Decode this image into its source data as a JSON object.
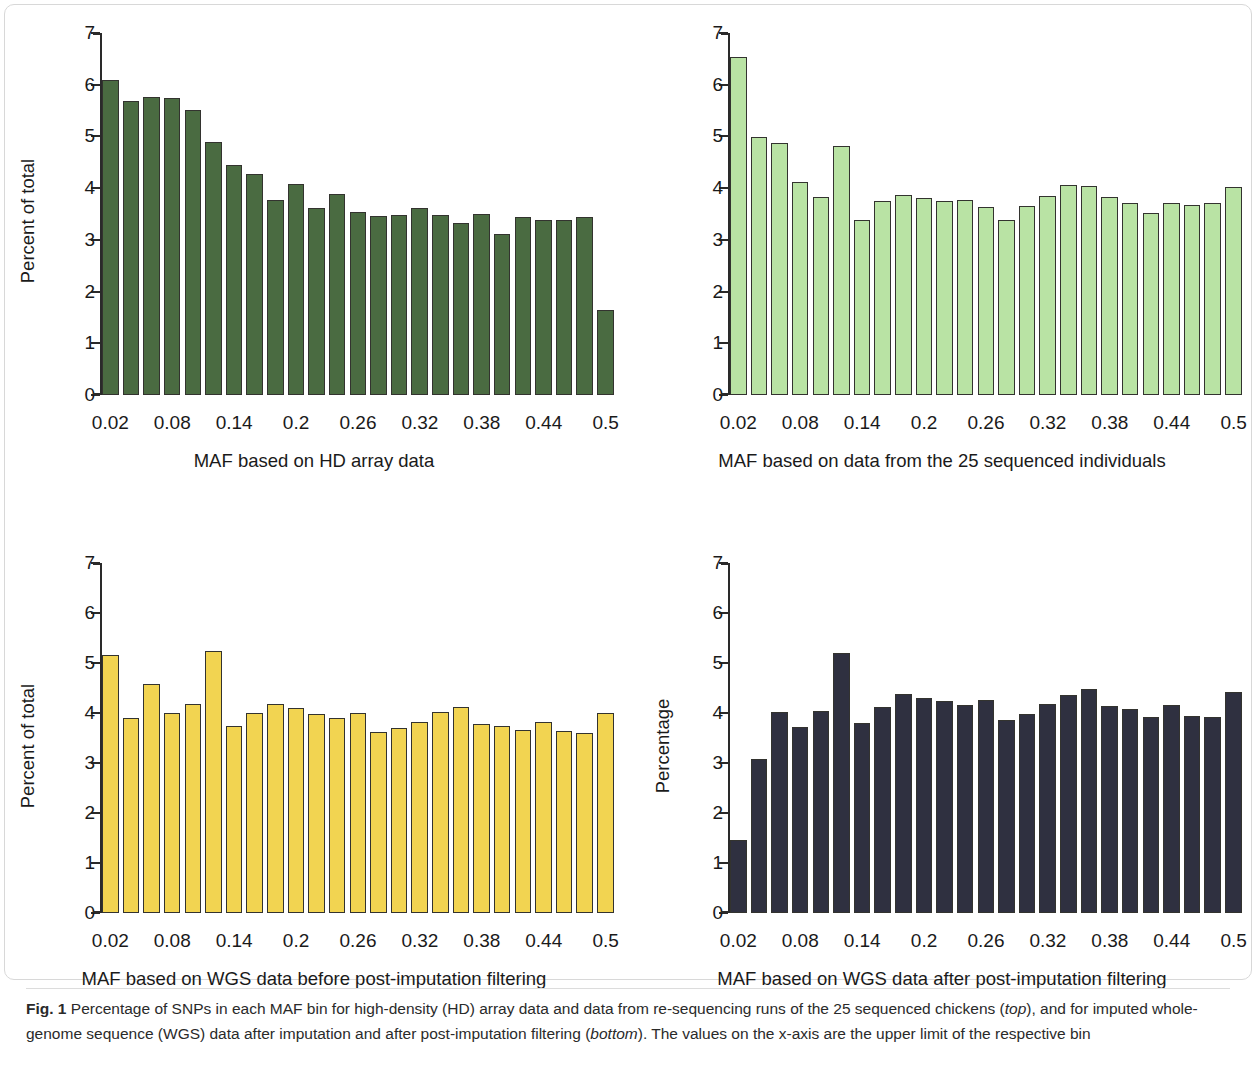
{
  "figure": {
    "label": "Fig. 1",
    "caption_part1": " Percentage of SNPs in each MAF bin for high-density (HD) array data and data from re-sequencing runs of the 25 sequenced chickens (",
    "caption_em1": "top",
    "caption_part2": "), and for imputed whole-genome sequence (WGS) data after imputation and after post-imputation filtering (",
    "caption_em2": "bottom",
    "caption_part3": "). The values on the x-axis are the upper limit of the respective bin"
  },
  "colors": {
    "hd_array": "#4a6b41",
    "sequenced_individuals": "#b9e3a4",
    "wgs_before": "#f2d451",
    "wgs_after": "#2f3040",
    "bar_border": "#33332f",
    "axis": "#2a2a2a"
  },
  "chart_data": [
    {
      "type": "bar",
      "id": "hd-array",
      "title": "",
      "xlabel": "MAF based on HD array data",
      "ylabel": "Percent of total",
      "ylim": [
        0,
        7
      ],
      "yticks": [
        0,
        1,
        2,
        3,
        4,
        5,
        6,
        7
      ],
      "ytick_labels": [
        "0",
        "1",
        "2",
        "3",
        "4",
        "5",
        "6",
        "7"
      ],
      "grid": false,
      "legend": "none",
      "categories": [
        "0.02",
        "0.04",
        "0.06",
        "0.08",
        "0.10",
        "0.12",
        "0.14",
        "0.16",
        "0.18",
        "0.20",
        "0.22",
        "0.24",
        "0.26",
        "0.28",
        "0.30",
        "0.32",
        "0.34",
        "0.36",
        "0.38",
        "0.40",
        "0.42",
        "0.44",
        "0.46",
        "0.48",
        "0.50"
      ],
      "xtick_labels": [
        "0.02",
        "0.08",
        "0.14",
        "0.2",
        "0.26",
        "0.32",
        "0.38",
        "0.44",
        "0.5"
      ],
      "xtick_indices": [
        0,
        3,
        6,
        9,
        12,
        15,
        18,
        21,
        24
      ],
      "values": [
        6.09,
        5.69,
        5.77,
        5.74,
        5.52,
        4.89,
        4.44,
        4.27,
        3.78,
        4.09,
        3.61,
        3.88,
        3.54,
        3.46,
        3.48,
        3.62,
        3.48,
        3.33,
        3.5,
        3.12,
        3.45,
        3.38,
        3.39,
        3.45,
        1.65
      ]
    },
    {
      "type": "bar",
      "id": "sequenced-individuals",
      "title": "",
      "xlabel": "MAF based on data from the 25 sequenced individuals",
      "ylabel": "",
      "ylim": [
        0,
        7
      ],
      "yticks": [
        0,
        1,
        2,
        3,
        4,
        5,
        6,
        7
      ],
      "ytick_labels": [
        "0",
        "1",
        "2",
        "3",
        "4",
        "5",
        "6",
        "7"
      ],
      "grid": false,
      "legend": "none",
      "categories": [
        "0.02",
        "0.04",
        "0.06",
        "0.08",
        "0.10",
        "0.12",
        "0.14",
        "0.16",
        "0.18",
        "0.20",
        "0.22",
        "0.24",
        "0.26",
        "0.28",
        "0.30",
        "0.32",
        "0.34",
        "0.36",
        "0.38",
        "0.40",
        "0.42",
        "0.44",
        "0.46",
        "0.48",
        "0.50"
      ],
      "xtick_labels": [
        "0.02",
        "0.08",
        "0.14",
        "0.2",
        "0.26",
        "0.32",
        "0.38",
        "0.44",
        "0.5"
      ],
      "xtick_indices": [
        0,
        3,
        6,
        9,
        12,
        15,
        18,
        21,
        24
      ],
      "values": [
        6.54,
        4.99,
        4.87,
        4.11,
        3.83,
        4.81,
        3.39,
        3.76,
        3.87,
        3.81,
        3.76,
        3.77,
        3.64,
        3.38,
        3.66,
        3.84,
        4.07,
        4.05,
        3.82,
        3.72,
        3.52,
        3.72,
        3.67,
        3.71,
        4.03
      ]
    },
    {
      "type": "bar",
      "id": "wgs-before-filtering",
      "title": "",
      "xlabel": "MAF based on WGS data before post-imputation filtering",
      "ylabel": "Percent of total",
      "ylim": [
        0,
        7
      ],
      "yticks": [
        0,
        1,
        2,
        3,
        4,
        5,
        6,
        7
      ],
      "ytick_labels": [
        "0",
        "1",
        "2",
        "3",
        "4",
        "5",
        "6",
        "7"
      ],
      "grid": false,
      "legend": "none",
      "categories": [
        "0.02",
        "0.04",
        "0.06",
        "0.08",
        "0.10",
        "0.12",
        "0.14",
        "0.16",
        "0.18",
        "0.20",
        "0.22",
        "0.24",
        "0.26",
        "0.28",
        "0.30",
        "0.32",
        "0.34",
        "0.36",
        "0.38",
        "0.40",
        "0.42",
        "0.44",
        "0.46",
        "0.48",
        "0.50"
      ],
      "xtick_labels": [
        "0.02",
        "0.08",
        "0.14",
        "0.2",
        "0.26",
        "0.32",
        "0.38",
        "0.44",
        "0.5"
      ],
      "xtick_indices": [
        0,
        3,
        6,
        9,
        12,
        15,
        18,
        21,
        24
      ],
      "values": [
        5.16,
        3.9,
        4.58,
        4.01,
        4.18,
        5.24,
        3.74,
        4.01,
        4.18,
        4.1,
        3.99,
        3.9,
        4.01,
        3.62,
        3.71,
        3.83,
        4.02,
        4.12,
        3.79,
        3.75,
        3.66,
        3.82,
        3.65,
        3.6,
        4.01
      ]
    },
    {
      "type": "bar",
      "id": "wgs-after-filtering",
      "title": "",
      "xlabel": "MAF based on WGS data after post-imputation filtering",
      "ylabel": "Percentage",
      "ylim": [
        0,
        7
      ],
      "yticks": [
        0,
        1,
        2,
        3,
        4,
        5,
        6,
        7
      ],
      "ytick_labels": [
        "0",
        "1",
        "2",
        "3",
        "4",
        "5",
        "6",
        "7"
      ],
      "grid": false,
      "legend": "none",
      "categories": [
        "0.02",
        "0.04",
        "0.06",
        "0.08",
        "0.10",
        "0.12",
        "0.14",
        "0.16",
        "0.18",
        "0.20",
        "0.22",
        "0.24",
        "0.26",
        "0.28",
        "0.30",
        "0.32",
        "0.34",
        "0.36",
        "0.38",
        "0.40",
        "0.42",
        "0.44",
        "0.46",
        "0.48",
        "0.50"
      ],
      "xtick_labels": [
        "0.02",
        "0.08",
        "0.14",
        "0.2",
        "0.26",
        "0.32",
        "0.38",
        "0.44",
        "0.5"
      ],
      "xtick_indices": [
        0,
        3,
        6,
        9,
        12,
        15,
        18,
        21,
        24
      ],
      "values": [
        1.47,
        3.09,
        4.02,
        3.72,
        4.05,
        5.21,
        3.81,
        4.12,
        4.38,
        4.31,
        4.25,
        4.16,
        4.26,
        3.87,
        3.99,
        4.18,
        4.36,
        4.48,
        4.14,
        4.09,
        3.93,
        4.17,
        3.95,
        3.93,
        4.42
      ]
    }
  ]
}
